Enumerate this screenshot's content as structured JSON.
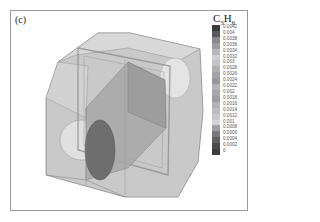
{
  "figure": {
    "panel_label": "(c)",
    "legend": {
      "title_main": "C",
      "title_sub1": "3",
      "title_mid": "H",
      "title_sub2": "6",
      "ticks": [
        "0.0042",
        "0.004",
        "0.0038",
        "0.0036",
        "0.0034",
        "0.0032",
        "0.003",
        "0.0028",
        "0.0026",
        "0.0024",
        "0.0022",
        "0.002",
        "0.0018",
        "0.0016",
        "0.0014",
        "0.0012",
        "0.001",
        "0.0008",
        "0.0006",
        "0.0004",
        "0.0002",
        "0"
      ],
      "colors": [
        "#3a3a3a",
        "#5a5a5a",
        "#8a8a8a",
        "#9c9c9c",
        "#b8b8b8",
        "#d0d0d0",
        "#c4c4c4",
        "#b0b0b0",
        "#a4a4a4",
        "#989898",
        "#b4b4b4",
        "#a8a8a8",
        "#9e9e9e",
        "#b2b2b2",
        "#bcbcbc",
        "#c8c8c8",
        "#d4d4d4",
        "#a0a0a0",
        "#7a7a7a",
        "#606060",
        "#4a4a4a",
        "#3c3c3c"
      ]
    }
  }
}
